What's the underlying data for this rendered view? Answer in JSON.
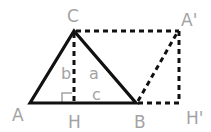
{
  "diagram": {
    "title": "",
    "colors": {
      "line": "#111111",
      "label": "#a3a3a3",
      "background": "#ffffff"
    },
    "points": {
      "A": {
        "label": "A",
        "x": 30,
        "y": 103
      },
      "B": {
        "label": "B",
        "x": 136,
        "y": 103
      },
      "C": {
        "label": "C",
        "x": 74,
        "y": 31
      },
      "H": {
        "label": "H",
        "x": 74,
        "y": 103
      },
      "A_prime": {
        "label": "A'",
        "x": 179,
        "y": 31
      },
      "H_prime": {
        "label": "H'",
        "x": 179,
        "y": 103
      }
    },
    "segment_labels": {
      "b": "b",
      "a": "a",
      "c": "c"
    },
    "solid_segments": [
      "A-C",
      "C-B",
      "A-B"
    ],
    "dashed_segments": [
      "C-H",
      "C-A'",
      "A'-H'",
      "B-H'",
      "B-A'"
    ],
    "right_angle_at": "H"
  }
}
